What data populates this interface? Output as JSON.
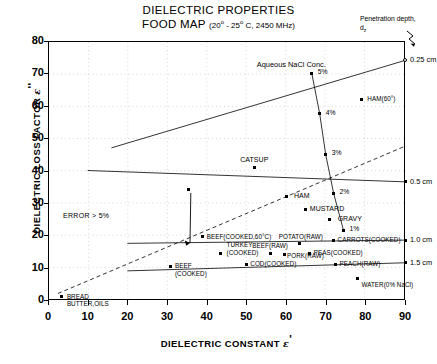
{
  "title": {
    "line1": "DIELECTRIC PROPERTIES",
    "line2_main": "FOOD MAP",
    "line2_cond": "(20 - 25 C, 2450 MHz)",
    "deg": "o"
  },
  "penetration": {
    "label_line1": "Penetration depth,",
    "label_line2_main": "d",
    "label_line2_sub": "z"
  },
  "axes": {
    "x_title_main": "DIELECTRIC CONSTANT",
    "x_title_sym": "ε",
    "x_title_prime": "'",
    "y_title_main": "DIELECTRIC LOSS FACTOR",
    "y_title_sym": "ε",
    "y_title_prime": "''",
    "x_ticks": [
      "0",
      "10",
      "20",
      "30",
      "40",
      "50",
      "60",
      "70",
      "80",
      "90"
    ],
    "y_ticks": [
      "0",
      "10",
      "20",
      "30",
      "40",
      "50",
      "60",
      "70",
      "80"
    ]
  },
  "annotations": {
    "nacl_title": "Aqueous NaCl Conc.",
    "error": "ERROR > 5%"
  },
  "chart_data": {
    "type": "scatter",
    "xlabel": "DIELECTRIC CONSTANT ε'",
    "ylabel": "DIELECTRIC LOSS FACTOR ε''",
    "xlim": [
      0,
      90
    ],
    "ylim": [
      0,
      80
    ],
    "grid": true,
    "legend": "none",
    "points": [
      {
        "name": "BUTTER,OILS",
        "label": "BREAD\nBUTTER,OILS",
        "x": 3.5,
        "y": 1.0,
        "marker": "filled"
      },
      {
        "name": "BREAD",
        "label": "",
        "x": 3.0,
        "y": 2.5,
        "marker": "none"
      },
      {
        "name": "BEEF(COOKED)",
        "label": "BEEF\n(COOKED)",
        "x": 31.0,
        "y": 10.5,
        "marker": "filled"
      },
      {
        "name": "TURKEY(COOKED)",
        "label": "TURKEY\n(COOKED)",
        "x": 43.5,
        "y": 14.5,
        "marker": "filled"
      },
      {
        "name": "COD(COOKED)",
        "label": "COD(COOKED)",
        "x": 50.0,
        "y": 11.0,
        "marker": "filled"
      },
      {
        "name": "BEEF(RAW)",
        "label": "BEEF(RAW)",
        "x": 56.0,
        "y": 14.5,
        "marker": "filled"
      },
      {
        "name": "PORK(RAW)",
        "label": "PORK(RAW)",
        "x": 59.5,
        "y": 14.0,
        "marker": "filled"
      },
      {
        "name": "POTATO(RAW)",
        "label": "POTATO(RAW)",
        "x": 63.5,
        "y": 17.5,
        "marker": "filled"
      },
      {
        "name": "PEAS(COOKED)",
        "label": "PEAS(COOKED)",
        "x": 66.0,
        "y": 14.5,
        "marker": "filled"
      },
      {
        "name": "CARROTS(COOKED)",
        "label": "CARROTS(COOKED)",
        "x": 72.0,
        "y": 18.5,
        "marker": "filled"
      },
      {
        "name": "PEACH(RAW)",
        "label": "PEACH(RAW)",
        "x": 72.5,
        "y": 11.0,
        "marker": "filled"
      },
      {
        "name": "WATER(0% NaCl)",
        "label": "WATER(0% NaCl)",
        "x": 78.0,
        "y": 6.5,
        "marker": "filled"
      },
      {
        "name": "BEEF(COOKED 60 C)",
        "label": "BEEF(COOKED,60°C)",
        "x": 39.0,
        "y": 19.5,
        "marker": "filled"
      },
      {
        "name": "MUSTARD",
        "label": "MUSTARD",
        "x": 65.0,
        "y": 28.0,
        "marker": "filled"
      },
      {
        "name": "HAM",
        "label": "HAM",
        "x": 60.0,
        "y": 32.0,
        "marker": "filled"
      },
      {
        "name": "CATSUP",
        "label": "CATSUP",
        "x": 52.0,
        "y": 41.0,
        "marker": "filled"
      },
      {
        "name": "GRAVY",
        "label": "GRAVY",
        "x": 71.0,
        "y": 25.0,
        "marker": "filled"
      },
      {
        "name": "HAM(60 C)",
        "label": "HAM(60°)",
        "x": 79.0,
        "y": 62.0,
        "marker": "filled"
      },
      {
        "name": "ERROR-5PCT-TIP",
        "label": "",
        "x": 35.5,
        "y": 34.0,
        "marker": "filled"
      }
    ],
    "series": [
      {
        "name": "Aqueous NaCl Conc.",
        "type": "line-with-markers",
        "points": [
          {
            "label": "5%",
            "x": 66.5,
            "y": 70.0
          },
          {
            "label": "4%",
            "x": 68.5,
            "y": 57.5
          },
          {
            "label": "3%",
            "x": 70.0,
            "y": 45.0
          },
          {
            "label": "2%",
            "x": 72.0,
            "y": 33.0
          },
          {
            "label": "1%",
            "x": 74.5,
            "y": 21.5
          }
        ]
      }
    ],
    "penetration_depth_lines": [
      {
        "label": "0.25 cm",
        "x0": 16.0,
        "y0": 47.0,
        "x1": 90.0,
        "y1": 74.0
      },
      {
        "label": "0.5 cm",
        "x0": 10.0,
        "y0": 40.0,
        "x1": 90.0,
        "y1": 36.5
      },
      {
        "label": "1.0 cm",
        "x0": 20.0,
        "y0": 17.5,
        "x1": 90.0,
        "y1": 18.5
      },
      {
        "label": "1.5 cm",
        "x0": 20.0,
        "y0": 9.0,
        "x1": 90.0,
        "y1": 11.5
      }
    ],
    "error_boundary": {
      "label": "ERROR > 5%",
      "type": "dashed-line",
      "x0": 2.5,
      "y0": 2.0,
      "x1": 90.0,
      "y1": 47.5
    },
    "depth_axis_labels": [
      "0.25 cm",
      "0.5 cm",
      "1.0 cm",
      "1.5 cm"
    ]
  }
}
